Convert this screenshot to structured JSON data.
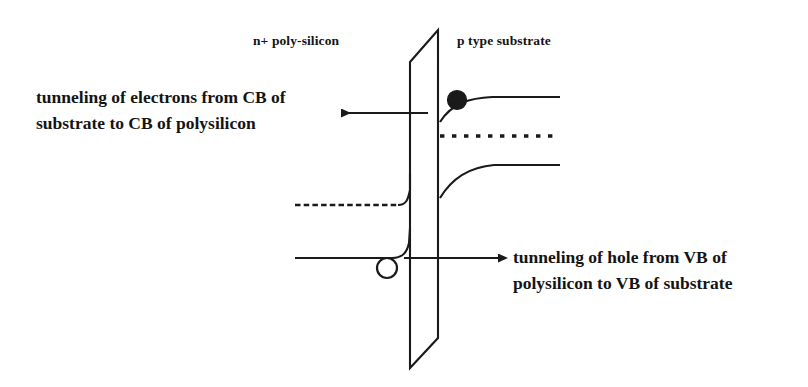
{
  "figure": {
    "background_color": "#ffffff",
    "line_color": "#1a1a1a"
  },
  "labels": {
    "left_region": "n+ poly-silicon",
    "right_region": "p type substrate",
    "electron_annotation_line1": "tunneling of electrons from CB of",
    "electron_annotation_line2": "substrate to CB of polysilicon",
    "hole_annotation_line1": "tunneling of hole from VB of",
    "hole_annotation_line2": "polysilicon to VB of substrate"
  },
  "diagram": {
    "oxide_barrier": {
      "name": "oxide-barrier-parallelogram",
      "top_left_x": 410,
      "top_left_y": 62,
      "top_right_x": 438,
      "top_right_y": 30,
      "bottom_right_x": 438,
      "bottom_right_y": 338,
      "bottom_left_x": 410,
      "bottom_left_y": 368
    },
    "left_bands": {
      "fermi_dashed_y": 205,
      "fermi_x_start": 295,
      "fermi_x_end": 405,
      "valence_band_y": 258,
      "valence_x_start": 295,
      "valence_x_end": 398
    },
    "right_bands": {
      "conduction_band_y": 106,
      "fermi_dashed_y": 136,
      "valence_band_y": 165,
      "x_start": 440,
      "x_end": 562,
      "band_bending_interface_cb_y": 122,
      "band_bending_interface_vb_y": 198
    },
    "electron": {
      "name": "electron-dot",
      "cx": 457,
      "cy": 100,
      "r": 9,
      "fill": "#1a1a1a"
    },
    "hole": {
      "name": "hole-circle",
      "cx": 387,
      "cy": 268,
      "r": 10,
      "fill": "none"
    },
    "electron_arrow": {
      "x_tail": 428,
      "x_head": 333,
      "y": 113,
      "direction": "left"
    },
    "hole_arrow": {
      "x_tail": 404,
      "x_head": 506,
      "y": 258,
      "direction": "right"
    }
  },
  "label_positions": {
    "left_region_x": 253,
    "left_region_y": 39,
    "right_region_x": 457,
    "right_region_y": 39,
    "electron_anno_x": 36,
    "electron_anno_y": 86,
    "hole_anno_x": 513,
    "hole_anno_y": 248
  }
}
